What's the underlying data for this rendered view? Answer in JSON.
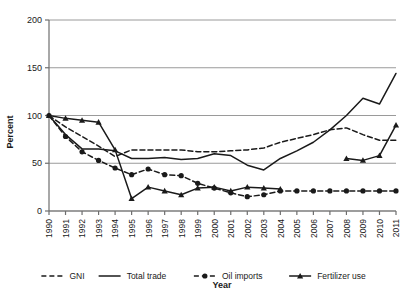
{
  "chart_data": {
    "type": "line",
    "title": "",
    "xlabel": "Year",
    "ylabel": "Percent",
    "xlim": [
      1990,
      2011
    ],
    "ylim": [
      0,
      200
    ],
    "yticks": [
      0,
      50,
      100,
      150,
      200
    ],
    "grid": true,
    "legend_position": "bottom",
    "x": [
      1990,
      1991,
      1992,
      1993,
      1994,
      1995,
      1996,
      1997,
      1998,
      1999,
      2000,
      2001,
      2002,
      2003,
      2004,
      2005,
      2006,
      2007,
      2008,
      2009,
      2010,
      2011
    ],
    "categories": [
      "1990",
      "1991",
      "1992",
      "1993",
      "1994",
      "1995",
      "1996",
      "1997",
      "1998",
      "1999",
      "2000",
      "2001",
      "2002",
      "2003",
      "2004",
      "2005",
      "2006",
      "2007",
      "2008",
      "2009",
      "2010",
      "2011"
    ],
    "series": [
      {
        "name": "GNI",
        "style": "dashed",
        "marker": "none",
        "color": "#1a1a1a",
        "values": [
          100,
          88,
          78,
          68,
          57,
          64,
          64,
          64,
          64,
          62,
          62,
          63,
          64,
          66,
          72,
          76,
          80,
          85,
          87,
          80,
          74,
          74
        ]
      },
      {
        "name": "Total trade",
        "style": "solid",
        "marker": "none",
        "color": "#1a1a1a",
        "values": [
          100,
          80,
          65,
          65,
          63,
          55,
          55,
          56,
          54,
          55,
          60,
          58,
          48,
          43,
          55,
          63,
          72,
          85,
          100,
          118,
          112,
          144
        ]
      },
      {
        "name": "Oil imports",
        "style": "dashed",
        "marker": "circle",
        "color": "#1a1a1a",
        "values": [
          100,
          78,
          62,
          53,
          45,
          38,
          44,
          38,
          37,
          29,
          24,
          19,
          15,
          17,
          21,
          21,
          21,
          21,
          21,
          21,
          21,
          21
        ]
      },
      {
        "name": "Fertilizer use",
        "style": "solid",
        "marker": "triangle",
        "color": "#1a1a1a",
        "values": [
          100,
          97,
          95,
          93,
          64,
          13,
          25,
          21,
          17,
          24,
          25,
          21,
          25,
          24,
          23,
          null,
          null,
          null,
          55,
          53,
          58,
          90
        ]
      }
    ]
  },
  "legend": {
    "items": [
      {
        "label": "GNI"
      },
      {
        "label": "Total trade"
      },
      {
        "label": "Oil imports"
      },
      {
        "label": "Fertilizer use"
      }
    ]
  },
  "axes": {
    "y_title": "Percent",
    "x_title": "Year"
  }
}
